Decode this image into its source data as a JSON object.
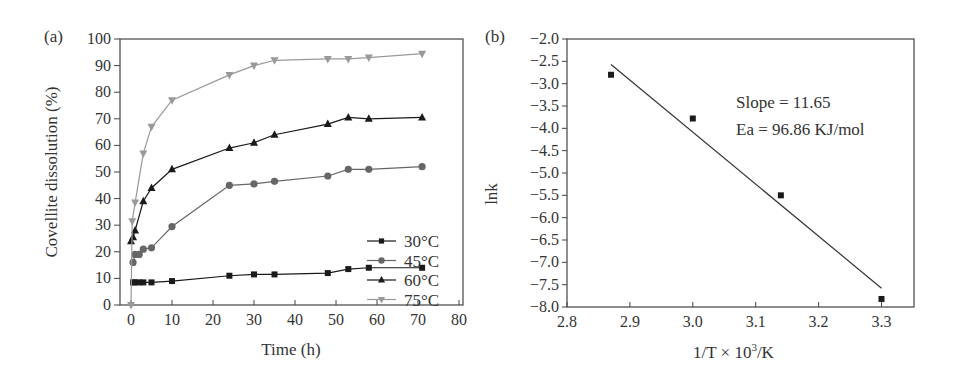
{
  "chart_data": [
    {
      "panel": "(a)",
      "type": "line",
      "title": "",
      "xlabel": "Time (h)",
      "ylabel": "Covellite dissolution (%)",
      "xlim": [
        0,
        80
      ],
      "ylim": [
        0,
        100
      ],
      "xticks": [
        0,
        10,
        20,
        30,
        40,
        50,
        60,
        70,
        80
      ],
      "yticks": [
        0,
        10,
        20,
        30,
        40,
        50,
        60,
        70,
        80,
        90,
        100
      ],
      "grid": false,
      "legend_position": "lower right",
      "series": [
        {
          "name": "30°C",
          "marker": "square",
          "color": "#1a1a1a",
          "x": [
            0.5,
            1,
            2,
            3,
            5,
            10,
            24,
            30,
            35,
            48,
            53,
            58,
            71
          ],
          "y": [
            8.5,
            8.5,
            8.5,
            8.5,
            8.5,
            9,
            11,
            11.5,
            11.5,
            12,
            13.5,
            14,
            14
          ]
        },
        {
          "name": "45°C",
          "marker": "circle",
          "color": "#666666",
          "x": [
            0.5,
            1,
            2,
            3,
            5,
            10,
            24,
            30,
            35,
            48,
            53,
            58,
            71
          ],
          "y": [
            16,
            19,
            19,
            21,
            21.5,
            29.5,
            45,
            45.5,
            46.5,
            48.5,
            51,
            51,
            52
          ]
        },
        {
          "name": "60°C",
          "marker": "triangle-up",
          "color": "#1a1a1a",
          "x": [
            0,
            0.5,
            1,
            3,
            5,
            10,
            24,
            30,
            35,
            48,
            53,
            58,
            71
          ],
          "y": [
            24,
            25.5,
            28,
            39,
            44,
            51,
            59,
            61,
            64,
            68,
            70.5,
            70,
            70.5
          ]
        },
        {
          "name": "75°C",
          "marker": "triangle-down",
          "color": "#999999",
          "x": [
            0,
            0.3,
            1,
            3,
            5,
            10,
            24,
            30,
            35,
            48,
            53,
            58,
            71
          ],
          "y": [
            0,
            31.5,
            38.5,
            57,
            67,
            77,
            86.5,
            90,
            92,
            92.5,
            92.5,
            93,
            94.5
          ]
        }
      ]
    },
    {
      "panel": "(b)",
      "type": "scatter",
      "title": "",
      "xlabel": "1/T × 10³/K",
      "ylabel": "lnk",
      "xlim": [
        2.8,
        3.35
      ],
      "ylim": [
        -8.0,
        -2.0
      ],
      "xticks": [
        2.8,
        2.9,
        3.0,
        3.1,
        3.2,
        3.3
      ],
      "yticks": [
        -2.0,
        -2.5,
        -3.0,
        -3.5,
        -4.0,
        -4.5,
        -5.0,
        -5.5,
        -6.0,
        -6.5,
        -7.0,
        -7.5,
        -8.0
      ],
      "grid": false,
      "series": [
        {
          "name": "data",
          "marker": "square",
          "color": "#1a1a1a",
          "x": [
            2.87,
            3.0,
            3.14,
            3.3
          ],
          "y": [
            -2.8,
            -3.78,
            -5.5,
            -7.82
          ]
        }
      ],
      "fit_line": {
        "x": [
          2.87,
          3.3
        ],
        "y": [
          -2.57,
          -7.58
        ],
        "color": "#333333"
      },
      "annotations": [
        "Slope = 11.65",
        "Ea = 96.86 KJ/mol"
      ]
    }
  ],
  "labels": {
    "panel_a": "(a)",
    "panel_b": "(b)",
    "a_xlabel": "Time (h)",
    "a_ylabel": "Covellite dissolution (%)",
    "b_xlabel_pre": "1/T × 10",
    "b_xlabel_sup": "3",
    "b_xlabel_post": "/K",
    "b_ylabel": "lnk",
    "annot_slope": "Slope = 11.65",
    "annot_ea": "Ea = 96.86 KJ/mol",
    "legend": [
      "30°C",
      "45°C",
      "60°C",
      "75°C"
    ]
  }
}
